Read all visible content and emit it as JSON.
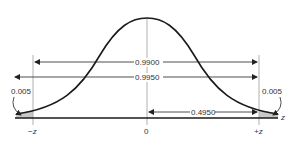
{
  "figure": {
    "type": "normal-distribution-diagram",
    "labels": {
      "inner_interval": "0.9900",
      "outer_interval": "0.9950",
      "half_interval": "0.4950",
      "left_tail": "0.005",
      "right_tail": "0.005"
    },
    "axis": {
      "left_tick": "−z",
      "center_tick": "0",
      "right_tick": "+z",
      "axis_label": "z"
    },
    "colors": {
      "curve": "#1a1a1a",
      "tail_fill": "#c8c8c8",
      "guide": "#b0b0b0"
    }
  }
}
